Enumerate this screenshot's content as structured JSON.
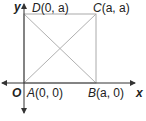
{
  "diagram": {
    "axes": {
      "x_label": "x",
      "y_label": "y",
      "origin_label": "O"
    },
    "points": {
      "A": {
        "name": "A",
        "coords": "(0, 0)"
      },
      "B": {
        "name": "B",
        "coords": "(a, 0)"
      },
      "C": {
        "name": "C",
        "coords": "(a, a)"
      },
      "D": {
        "name": "D",
        "coords": "(0, a)"
      }
    },
    "colors": {
      "axis": "#333333",
      "square": "#aaaaaa",
      "diagonal": "#b0b0b0"
    }
  }
}
